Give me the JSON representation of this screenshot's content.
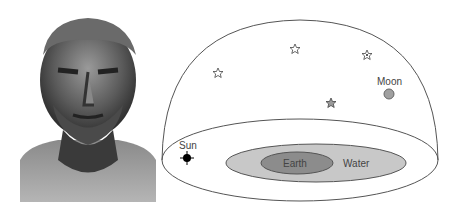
{
  "figure": {
    "left_image": {
      "subject": "bust-sculpture",
      "style": "grayscale photograph"
    },
    "diagram": {
      "title": "",
      "labels": {
        "sun": "Sun",
        "moon": "Moon",
        "earth": "Earth",
        "water": "Water"
      },
      "stars_count": 4,
      "colors": {
        "outline": "#555555",
        "water_fill": "#c8c8c8",
        "earth_fill": "#8c8c8c",
        "moon_fill": "#a0a0a0",
        "sun_fill": "#000000",
        "filled_star": "#9a9a9a"
      }
    }
  }
}
